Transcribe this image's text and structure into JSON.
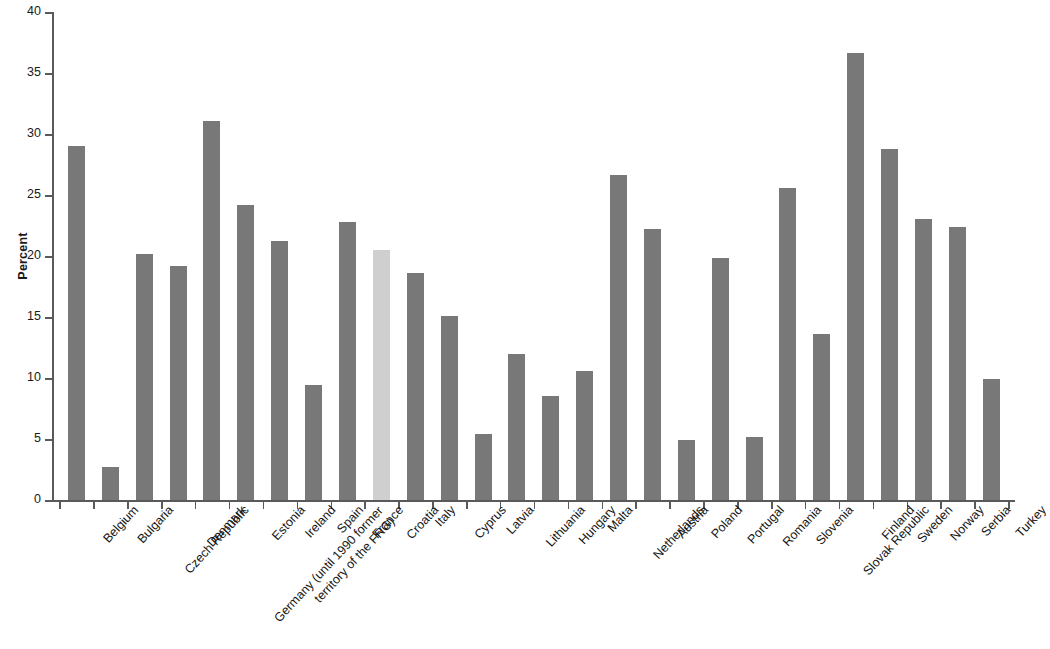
{
  "chart_data": {
    "type": "bar",
    "title": "",
    "subtitle": "",
    "xlabel": "",
    "ylabel": "Percent",
    "ylim": [
      0,
      40
    ],
    "yticks": [
      0,
      5,
      10,
      15,
      20,
      25,
      30,
      35,
      40
    ],
    "grid": false,
    "legend": "none",
    "highlight_category": "Croatia",
    "colors": {
      "bar": "#787878",
      "bar_highlight": "#cfcfcf",
      "axis": "#5a5a5a",
      "text": "#161616",
      "background": "#ffffff"
    },
    "categories": [
      "Belgium",
      "Bulgaria",
      "Czech Republic",
      "Denmark",
      "Germany (until 1990 former\nterritory of the FRG)",
      "Estonia",
      "Ireland",
      "Spain",
      "France",
      "Croatia",
      "Italy",
      "Cyprus",
      "Latvia",
      "Lithuania",
      "Hungary",
      "Malta",
      "Netherlands",
      "Austria",
      "Poland",
      "Portugal",
      "Romania",
      "Slovenia",
      "Slovak Republic",
      "Finland",
      "Sweden",
      "Norway",
      "Serbia",
      "Turkey"
    ],
    "values": [
      29.0,
      2.7,
      20.2,
      19.2,
      31.1,
      24.2,
      21.2,
      9.4,
      22.8,
      20.5,
      18.6,
      15.1,
      5.4,
      12.0,
      8.5,
      10.6,
      26.6,
      22.2,
      4.9,
      19.8,
      5.2,
      25.6,
      13.6,
      36.6,
      28.8,
      23.0,
      22.4,
      9.9
    ]
  }
}
